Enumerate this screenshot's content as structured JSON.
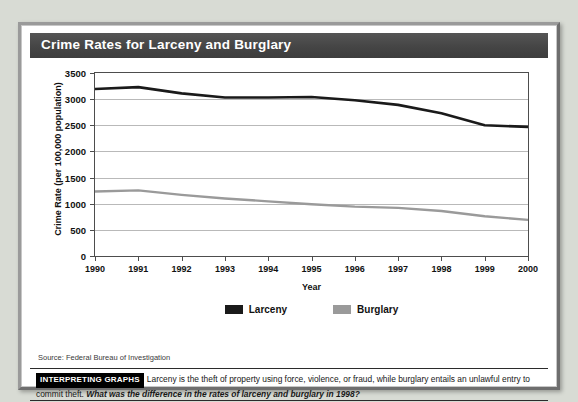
{
  "figure": {
    "title": "Crime Rates for Larceny and Burglary",
    "source": "Source: Federal Bureau of Investigation"
  },
  "caption": {
    "tag": "INTERPRETING GRAPHS",
    "body": "Larceny is the theft of property using force, violence, or fraud, while burglary entails an unlawful entry to commit theft.",
    "question": "What was the difference in the rates of larceny and burglary in 1998?"
  },
  "colors": {
    "larceny": "#1a1a1a",
    "burglary": "#9a9a9a",
    "title_band": "#4a4a4a",
    "gridline": "#b9b9b9",
    "axis": "#4d4d4d",
    "page_background": "#d8dbd4"
  },
  "chart_data": {
    "type": "line",
    "title": "Crime Rates for Larceny and Burglary",
    "xlabel": "Year",
    "ylabel": "Crime Rate (per 100,000 population)",
    "categories": [
      "1990",
      "1991",
      "1992",
      "1993",
      "1994",
      "1995",
      "1996",
      "1997",
      "1998",
      "1999",
      "2000"
    ],
    "x": [
      1990,
      1991,
      1992,
      1993,
      1994,
      1995,
      1996,
      1997,
      1998,
      1999,
      2000
    ],
    "xlim": [
      1990,
      2000
    ],
    "ylim": [
      0,
      3500
    ],
    "yticks": [
      0,
      500,
      1000,
      1500,
      2000,
      2500,
      3000,
      3500
    ],
    "ytick_labels": [
      "0",
      "500",
      "1000",
      "1500",
      "2000",
      "2500",
      "3000",
      "3500"
    ],
    "grid": true,
    "legend_position": "bottom-center",
    "series": [
      {
        "name": "Larceny",
        "color": "#1a1a1a",
        "values": [
          3195,
          3230,
          3110,
          3030,
          3030,
          3040,
          2980,
          2890,
          2730,
          2500,
          2470
        ]
      },
      {
        "name": "Burglary",
        "color": "#9a9a9a",
        "values": [
          1235,
          1255,
          1170,
          1100,
          1045,
          990,
          945,
          920,
          860,
          760,
          690
        ]
      }
    ]
  }
}
